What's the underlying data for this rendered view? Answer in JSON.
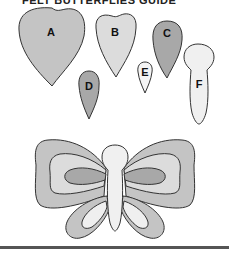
{
  "title": "FELT BUTTERFLIES GUIDE",
  "colors": {
    "dark": "#a8a8a8",
    "medium": "#c4c4c4",
    "light": "#efefef",
    "outline": "#333333",
    "rule": "#555555"
  },
  "pieces": [
    {
      "id": "A",
      "label": "A",
      "shape": "large-heart",
      "fill": "medium-gray"
    },
    {
      "id": "B",
      "label": "B",
      "shape": "medium-heart",
      "fill": "light-gray"
    },
    {
      "id": "C",
      "label": "C",
      "shape": "teardrop",
      "fill": "dark-gray"
    },
    {
      "id": "D",
      "label": "D",
      "shape": "small-teardrop",
      "fill": "dark-gray"
    },
    {
      "id": "E",
      "label": "E",
      "shape": "tiny-teardrop",
      "fill": "white"
    },
    {
      "id": "F",
      "label": "F",
      "shape": "body",
      "fill": "white"
    }
  ],
  "assembled": {
    "description": "Assembled felt butterfly"
  }
}
